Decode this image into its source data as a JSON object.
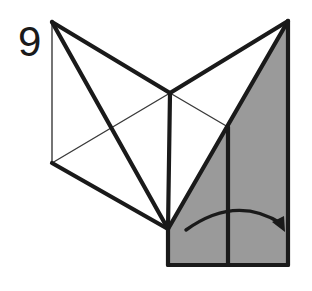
{
  "figure": {
    "step_number": "9",
    "kind": "origami-fold-diagram",
    "background_color": "#ffffff",
    "paper_shaded_color": "#9a9a9a",
    "paper_white_color": "#ffffff",
    "line_color": "#1a1a1a",
    "thick_line_width": 4.2,
    "thin_line_width": 1.4,
    "arrow_label": "fold-right-arrow"
  },
  "geometry": {
    "points": {
      "top_left_apex": [
        52,
        22
      ],
      "top_right_apex": [
        288,
        21
      ],
      "left_vertex": [
        52,
        163
      ],
      "center_junction": [
        170,
        93
      ],
      "bottom_junction": [
        168,
        229
      ],
      "right_edge_junction": [
        228,
        127
      ],
      "left_crossing": [
        113,
        126
      ],
      "rect_bottom_left": [
        168,
        265
      ],
      "rect_bottom_right": [
        288,
        265
      ],
      "rect_mid_top": [
        228,
        127
      ],
      "rect_mid_bottom": [
        228,
        265
      ]
    },
    "shaded_regions": [
      {
        "name": "left-shaded-triangle",
        "polygon": "52,22 170,93 168,229"
      },
      {
        "name": "right-shaded-wedge",
        "polygon": "288,21 288,265 168,265 168,229 228,127"
      }
    ],
    "white_regions": [
      {
        "name": "left-white-panel",
        "polygon": "52,22 52,163 168,229 170,93"
      },
      {
        "name": "center-white-panel",
        "polygon": "170,93 228,127 168,229"
      },
      {
        "name": "upper-white-panel",
        "polygon": "170,93 288,21 228,127"
      }
    ],
    "thick_lines": [
      {
        "name": "top-left-to-center",
        "from": [
          52,
          22
        ],
        "to": [
          170,
          93
        ]
      },
      {
        "name": "top-left-to-bottom-junction",
        "from": [
          52,
          22
        ],
        "to": [
          168,
          229
        ]
      },
      {
        "name": "center-to-bottom-junction",
        "from": [
          170,
          93
        ],
        "to": [
          168,
          229
        ]
      },
      {
        "name": "left-vertex-to-bottom-junction",
        "from": [
          52,
          163
        ],
        "to": [
          168,
          229
        ]
      },
      {
        "name": "center-to-top-right",
        "from": [
          170,
          93
        ],
        "to": [
          288,
          21
        ]
      },
      {
        "name": "bottom-junction-to-top-right",
        "from": [
          168,
          229
        ],
        "to": [
          288,
          21
        ]
      },
      {
        "name": "right-vertical-edge",
        "from": [
          288,
          21
        ],
        "to": [
          288,
          265
        ]
      },
      {
        "name": "rect-bottom-edge",
        "from": [
          168,
          265
        ],
        "to": [
          288,
          265
        ]
      },
      {
        "name": "rect-left-edge",
        "from": [
          168,
          229
        ],
        "to": [
          168,
          265
        ]
      },
      {
        "name": "rect-mid-vertical",
        "from": [
          228,
          127
        ],
        "to": [
          228,
          265
        ]
      }
    ],
    "thin_lines": [
      {
        "name": "left-vertical-edge",
        "from": [
          52,
          22
        ],
        "to": [
          52,
          163
        ]
      },
      {
        "name": "left-crease-to-left-vertex",
        "from": [
          52,
          163
        ],
        "to": [
          170,
          93
        ]
      },
      {
        "name": "center-crease-to-right-junction",
        "from": [
          170,
          93
        ],
        "to": [
          228,
          127
        ]
      }
    ],
    "arrow": {
      "name": "fold-right-arrow",
      "path": "M 186,230 Q 236,194 282,224",
      "head_tip": [
        285,
        232
      ],
      "head_left": [
        272,
        222
      ],
      "head_right": [
        284,
        216
      ]
    },
    "step_number_position": [
      18,
      56
    ]
  }
}
